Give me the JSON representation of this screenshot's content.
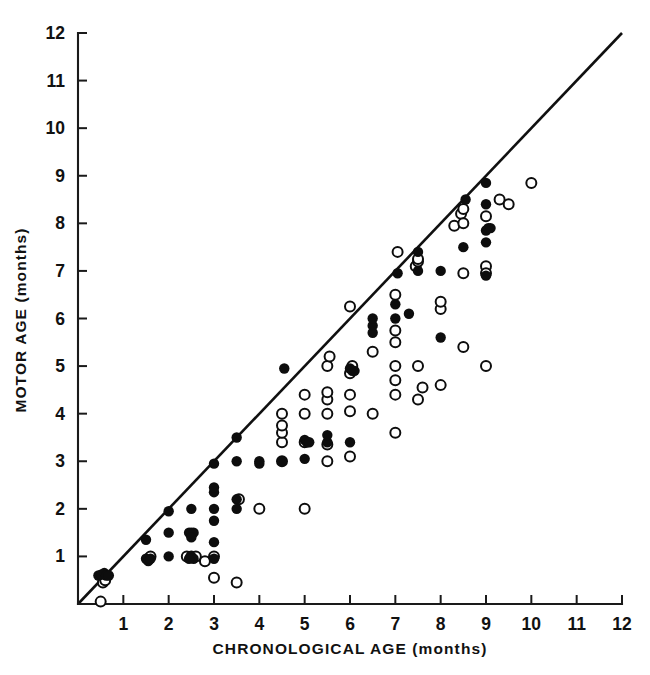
{
  "figure": {
    "background": "#ffffff",
    "ink_color": "#111111"
  },
  "chart_data": {
    "type": "scatter",
    "title": "",
    "xlabel": "CHRONOLOGICAL AGE (months)",
    "ylabel": "MOTOR AGE (months)",
    "xlim": [
      0,
      12
    ],
    "ylim": [
      0,
      12
    ],
    "xticks": [
      1,
      2,
      3,
      4,
      5,
      6,
      7,
      8,
      9,
      10,
      11,
      12
    ],
    "yticks": [
      1,
      2,
      3,
      4,
      5,
      6,
      7,
      8,
      9,
      10,
      11,
      12
    ],
    "xtick_labels": [
      "1",
      "2",
      "3",
      "4",
      "5",
      "6",
      "7",
      "8",
      "9",
      "10",
      "11",
      "12"
    ],
    "ytick_labels": [
      "1",
      "2",
      "3",
      "4",
      "5",
      "6",
      "7",
      "8",
      "9",
      "10",
      "11",
      "12"
    ],
    "grid": false,
    "legend_position": "none",
    "annotations": [
      {
        "name": "identity-reference-line",
        "kind": "line",
        "x": [
          0,
          12
        ],
        "y": [
          0,
          12
        ],
        "description": "diagonal line of equality (motor age = chronological age)"
      }
    ],
    "series": [
      {
        "name": "filled-circles",
        "marker": "filled-circle",
        "color": "#0d0d0d",
        "points": [
          [
            0.45,
            0.6
          ],
          [
            0.52,
            0.62
          ],
          [
            0.58,
            0.65
          ],
          [
            0.62,
            0.6
          ],
          [
            0.68,
            0.6
          ],
          [
            1.5,
            0.95
          ],
          [
            1.55,
            0.9
          ],
          [
            1.6,
            0.95
          ],
          [
            1.5,
            1.35
          ],
          [
            2.0,
            1.0
          ],
          [
            2.0,
            1.5
          ],
          [
            2.0,
            1.95
          ],
          [
            2.45,
            1.5
          ],
          [
            2.5,
            1.5
          ],
          [
            2.55,
            1.5
          ],
          [
            2.5,
            1.4
          ],
          [
            2.5,
            1.0
          ],
          [
            2.55,
            0.95
          ],
          [
            2.45,
            0.95
          ],
          [
            2.5,
            2.0
          ],
          [
            3.0,
            0.95
          ],
          [
            3.0,
            1.3
          ],
          [
            3.0,
            1.75
          ],
          [
            3.0,
            2.0
          ],
          [
            3.0,
            2.35
          ],
          [
            3.0,
            2.45
          ],
          [
            3.0,
            2.95
          ],
          [
            3.5,
            2.2
          ],
          [
            3.5,
            2.0
          ],
          [
            3.5,
            3.0
          ],
          [
            3.5,
            3.5
          ],
          [
            4.0,
            3.0
          ],
          [
            4.0,
            2.95
          ],
          [
            4.5,
            3.0
          ],
          [
            4.55,
            4.95
          ],
          [
            5.0,
            3.05
          ],
          [
            5.0,
            3.45
          ],
          [
            5.05,
            3.4
          ],
          [
            5.1,
            3.4
          ],
          [
            5.5,
            3.4
          ],
          [
            5.5,
            3.55
          ],
          [
            6.0,
            3.4
          ],
          [
            6.0,
            4.95
          ],
          [
            6.05,
            4.9
          ],
          [
            6.1,
            4.9
          ],
          [
            6.5,
            5.7
          ],
          [
            6.5,
            5.85
          ],
          [
            6.5,
            6.0
          ],
          [
            7.0,
            6.3
          ],
          [
            7.0,
            6.0
          ],
          [
            7.05,
            6.95
          ],
          [
            7.3,
            6.1
          ],
          [
            7.5,
            7.0
          ],
          [
            7.5,
            7.4
          ],
          [
            8.0,
            5.6
          ],
          [
            8.0,
            7.0
          ],
          [
            8.5,
            7.5
          ],
          [
            8.55,
            8.5
          ],
          [
            9.0,
            6.9
          ],
          [
            9.0,
            7.6
          ],
          [
            9.0,
            7.85
          ],
          [
            9.05,
            7.9
          ],
          [
            9.1,
            7.9
          ],
          [
            9.0,
            8.4
          ],
          [
            9.0,
            8.85
          ]
        ]
      },
      {
        "name": "open-circles",
        "marker": "open-circle",
        "color": "#0d0d0d",
        "points": [
          [
            0.5,
            0.05
          ],
          [
            0.55,
            0.45
          ],
          [
            0.6,
            0.5
          ],
          [
            1.55,
            0.95
          ],
          [
            1.6,
            1.0
          ],
          [
            2.4,
            1.0
          ],
          [
            2.5,
            1.0
          ],
          [
            2.6,
            1.0
          ],
          [
            2.8,
            0.9
          ],
          [
            3.0,
            1.0
          ],
          [
            3.0,
            0.55
          ],
          [
            3.5,
            0.45
          ],
          [
            3.55,
            2.2
          ],
          [
            4.0,
            2.0
          ],
          [
            4.5,
            3.0
          ],
          [
            4.5,
            3.4
          ],
          [
            4.5,
            3.6
          ],
          [
            4.5,
            3.75
          ],
          [
            4.5,
            4.0
          ],
          [
            5.0,
            2.0
          ],
          [
            5.0,
            3.4
          ],
          [
            5.0,
            4.0
          ],
          [
            5.0,
            4.4
          ],
          [
            5.5,
            3.0
          ],
          [
            5.5,
            3.35
          ],
          [
            5.5,
            4.0
          ],
          [
            5.5,
            4.3
          ],
          [
            5.5,
            4.45
          ],
          [
            5.5,
            5.0
          ],
          [
            5.55,
            5.2
          ],
          [
            6.0,
            3.1
          ],
          [
            6.0,
            4.05
          ],
          [
            6.0,
            4.4
          ],
          [
            6.0,
            4.85
          ],
          [
            6.0,
            6.25
          ],
          [
            6.05,
            5.0
          ],
          [
            6.5,
            4.0
          ],
          [
            6.5,
            5.3
          ],
          [
            7.0,
            3.6
          ],
          [
            7.0,
            4.4
          ],
          [
            7.0,
            4.7
          ],
          [
            7.0,
            5.0
          ],
          [
            7.0,
            5.5
          ],
          [
            7.0,
            5.75
          ],
          [
            7.0,
            6.5
          ],
          [
            7.05,
            7.4
          ],
          [
            7.45,
            7.1
          ],
          [
            7.5,
            7.2
          ],
          [
            7.5,
            7.25
          ],
          [
            7.5,
            4.3
          ],
          [
            7.5,
            5.0
          ],
          [
            7.6,
            4.55
          ],
          [
            8.0,
            4.6
          ],
          [
            8.0,
            6.2
          ],
          [
            8.0,
            6.35
          ],
          [
            8.3,
            7.95
          ],
          [
            8.45,
            8.2
          ],
          [
            8.5,
            8.3
          ],
          [
            8.5,
            8.0
          ],
          [
            8.5,
            5.4
          ],
          [
            8.5,
            6.95
          ],
          [
            9.0,
            8.15
          ],
          [
            9.0,
            7.1
          ],
          [
            9.0,
            5.0
          ],
          [
            9.0,
            6.95
          ],
          [
            9.3,
            8.5
          ],
          [
            9.5,
            8.4
          ],
          [
            10.0,
            8.85
          ]
        ]
      }
    ]
  },
  "axes": {
    "x_title": "CHRONOLOGICAL AGE (months)",
    "y_title": "MOTOR AGE (months)"
  }
}
